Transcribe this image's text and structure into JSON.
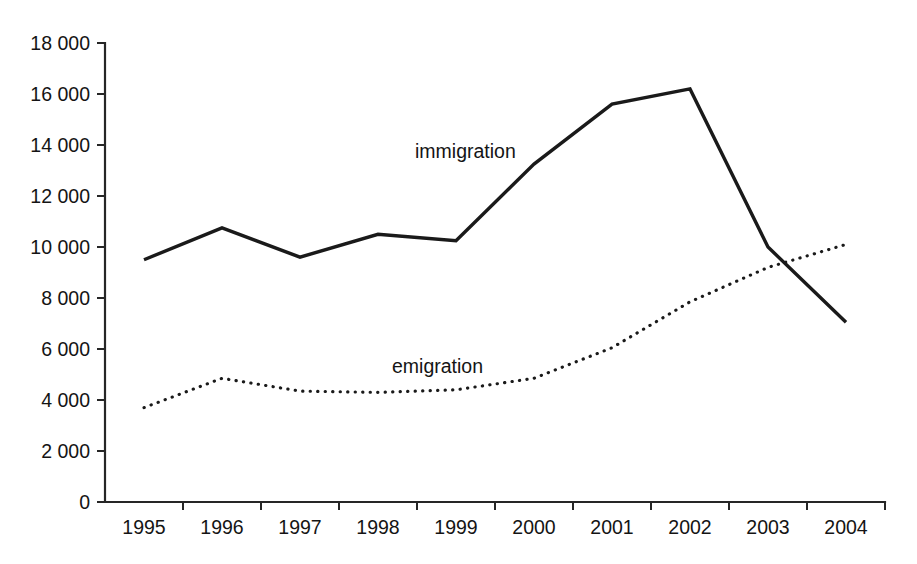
{
  "chart_data": {
    "type": "line",
    "title": "",
    "subtitle": "",
    "xlabel": "",
    "ylabel": "",
    "categories": [
      "1995",
      "1996",
      "1997",
      "1998",
      "1999",
      "2000",
      "2001",
      "2002",
      "2003",
      "2004"
    ],
    "series": [
      {
        "name": "immigration",
        "style": "solid",
        "values": [
          9500,
          10750,
          9600,
          10500,
          10250,
          13250,
          15600,
          16200,
          10000,
          7050
        ]
      },
      {
        "name": "emigration",
        "style": "dotted",
        "values": [
          3700,
          4850,
          4350,
          4300,
          4400,
          4850,
          6050,
          7850,
          9200,
          10100
        ]
      }
    ],
    "ylim": [
      0,
      18000
    ],
    "ytick_values": [
      0,
      2000,
      4000,
      6000,
      8000,
      10000,
      12000,
      14000,
      16000,
      18000
    ],
    "ytick_labels": [
      "0",
      "2 000",
      "4 000",
      "6 000",
      "8 000",
      "10 000",
      "12 000",
      "14 000",
      "16 000",
      "18 000"
    ],
    "grid": false,
    "legend_position": "inline-annotations",
    "annotations": [
      {
        "text": "immigration",
        "x": 415,
        "y": 158
      },
      {
        "text": "emigration",
        "x": 392,
        "y": 373
      }
    ],
    "colors": {
      "axis": "#262626",
      "immigration": "#1a1a1a",
      "emigration": "#1a1a1a",
      "background": "#ffffff"
    }
  },
  "plot_geometry": {
    "left": 105,
    "right": 885,
    "top": 43,
    "bottom": 502
  }
}
